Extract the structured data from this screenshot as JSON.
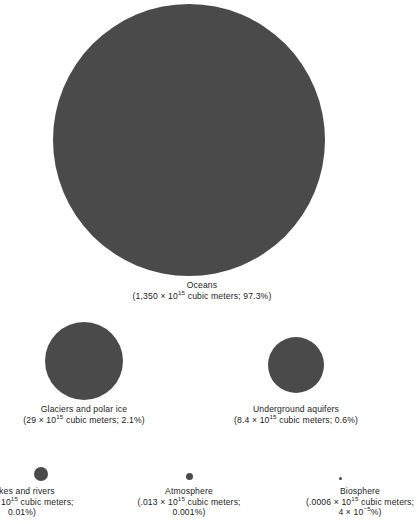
{
  "chart_data": {
    "type": "bubble",
    "title": "",
    "subtitle": "",
    "xlabel": "",
    "ylabel": "",
    "legend_position": "none",
    "grid": false,
    "value_unit": "10^15 cubic meters",
    "area_encoding": "circle area proportional to water volume",
    "categories": [
      "Oceans",
      "Glaciers and polar ice",
      "Underground aquifers",
      "Lakes and rivers",
      "Atmosphere",
      "Biosphere"
    ],
    "values": [
      1350,
      29,
      8.4,
      0.13,
      0.013,
      0.0006
    ],
    "percentages": [
      97.3,
      2.1,
      0.6,
      0.01,
      0.001,
      4e-05
    ],
    "circle_diameters_px": [
      272,
      78,
      56,
      14,
      7,
      3.2
    ]
  },
  "figure": {
    "fill_color": "#4a4a4a",
    "background_color": "#ffffff",
    "text_color": "#1c1c1c"
  },
  "items": {
    "oceans": {
      "name": "Oceans",
      "detail_pre": "(1,350 ",
      "times": "×",
      "base": " 10",
      "exponent": "15",
      "detail_post": " cubic meters; 97.3%)"
    },
    "glaciers": {
      "name": "Glaciers and polar ice",
      "detail_pre": "(29 ",
      "times": "×",
      "base": " 10",
      "exponent": "15",
      "detail_post": " cubic meters; 2.1%)"
    },
    "aquifers": {
      "name": "Underground aquifers",
      "detail_pre": "(8.4 ",
      "times": "×",
      "base": " 10",
      "exponent": "15",
      "detail_post": " cubic meters; 0.6%)"
    },
    "lakes": {
      "name": "Lakes and rivers",
      "detail_pre": "(0.13 ",
      "times": "×",
      "base": " 10",
      "exponent": "15",
      "detail_post": " cubic meters;",
      "detail_line3": "0.01%)"
    },
    "atmosphere": {
      "name": "Atmosphere",
      "detail_pre": "(.013 ",
      "times": "×",
      "base": " 10",
      "exponent": "15",
      "detail_post": " cubic meters;",
      "detail_line3": "0.001%)"
    },
    "biosphere": {
      "name": "Biosphere",
      "detail_pre": "(.0006 ",
      "times": "×",
      "base": " 10",
      "exponent": "15",
      "detail_post": " cubic meters;",
      "detail_line3_pre": "4 ",
      "detail_line3_times": "×",
      "detail_line3_base": " 10",
      "detail_line3_exponent": "−5",
      "detail_line3_post": "%)"
    }
  }
}
